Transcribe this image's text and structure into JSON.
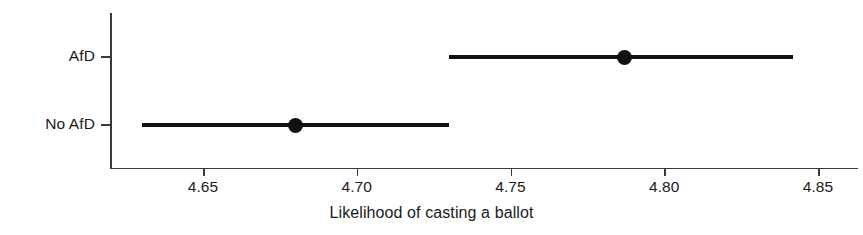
{
  "chart_data": {
    "type": "scatter",
    "title": "",
    "subtitle": "",
    "xlabel": "Likelihood of casting a ballot",
    "ylabel": "",
    "orientation": "horizontal",
    "grid": false,
    "legend": "none",
    "xlim": [
      4.625,
      4.865
    ],
    "xticks": [
      4.65,
      4.7,
      4.75,
      4.8,
      4.85
    ],
    "xticklabels": [
      "4.65",
      "4.70",
      "4.75",
      "4.80",
      "4.85"
    ],
    "categories": [
      "AfD",
      "No AfD"
    ],
    "series": [
      {
        "name": "Predicted likelihood",
        "values": [
          4.787,
          4.68
        ],
        "ci_low": [
          4.73,
          4.63
        ],
        "ci_high": [
          4.842,
          4.73
        ]
      }
    ],
    "points": [
      {
        "category": "AfD",
        "estimate": 4.787,
        "ci_low": 4.73,
        "ci_high": 4.842,
        "marker": "filled-circle",
        "color": "#111111"
      },
      {
        "category": "No AfD",
        "estimate": 4.68,
        "ci_low": 4.63,
        "ci_high": 4.73,
        "marker": "filled-circle",
        "color": "#111111"
      }
    ],
    "colors": {
      "background": "#ffffff",
      "axis": "#3a3a3a",
      "marker": "#111111",
      "interval": "#111111",
      "text": "#1a1a1a"
    }
  },
  "axis": {
    "x_title": "Likelihood of casting a ballot",
    "x_ticklabels": [
      "4.65",
      "4.70",
      "4.75",
      "4.80",
      "4.85"
    ],
    "y_ticklabels": [
      "AfD",
      "No AfD"
    ]
  }
}
